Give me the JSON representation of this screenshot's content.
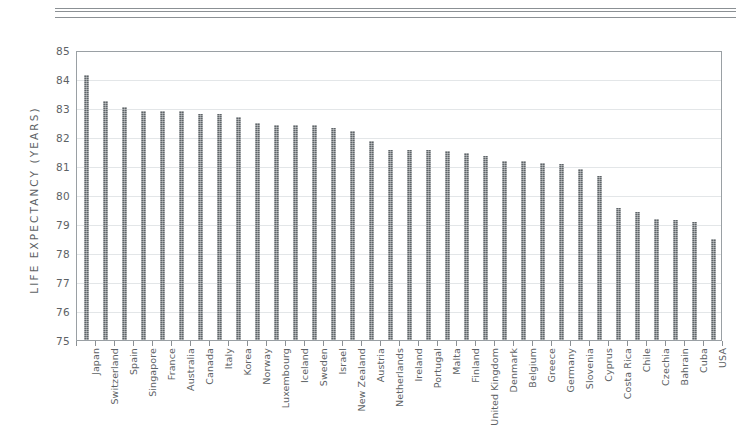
{
  "chart_data": {
    "type": "bar",
    "title": "",
    "xlabel": "",
    "ylabel": "LIFE EXPECTANCY (YEARS)",
    "ylim": [
      75,
      85
    ],
    "yticks": [
      75,
      76,
      77,
      78,
      79,
      80,
      81,
      82,
      83,
      84,
      85
    ],
    "grid": true,
    "legend": "none",
    "bar_color": "#5e6468",
    "categories": [
      "Japan",
      "Switzerland",
      "Spain",
      "Singapore",
      "France",
      "Australia",
      "Canada",
      "Italy",
      "Korea",
      "Norway",
      "Luxembourg",
      "Iceland",
      "Sweden",
      "Israel",
      "New Zealand",
      "Austria",
      "Netherlands",
      "Ireland",
      "Portugal",
      "Malta",
      "Finland",
      "United Kingdom",
      "Denmark",
      "Belgium",
      "Greece",
      "Germany",
      "Slovenia",
      "Cyprus",
      "Costa Rica",
      "Chile",
      "Czechia",
      "Bahrain",
      "Cuba",
      "USA"
    ],
    "values": [
      84.2,
      83.3,
      83.1,
      82.95,
      82.95,
      82.95,
      82.85,
      82.85,
      82.75,
      82.55,
      82.45,
      82.45,
      82.45,
      82.35,
      82.25,
      81.9,
      81.6,
      81.6,
      81.6,
      81.55,
      81.5,
      81.4,
      81.2,
      81.2,
      81.15,
      81.1,
      80.95,
      80.7,
      79.6,
      79.45,
      79.2,
      79.15,
      79.1,
      78.5
    ],
    "value_unit": "years"
  },
  "axis": {
    "y_title": "LIFE EXPECTANCY (YEARS)"
  }
}
